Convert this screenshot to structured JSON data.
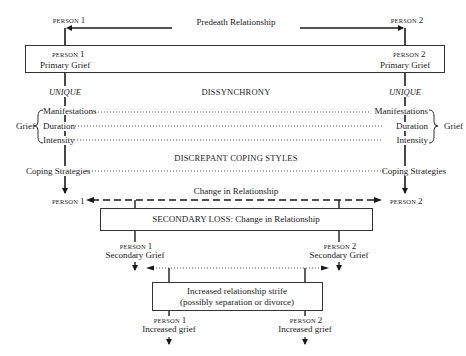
{
  "diagram": {
    "top": {
      "person1": "PERSON",
      "person1_num": "1",
      "person2": "PERSON",
      "person2_num": "2",
      "relationship": "Predeath Relationship"
    },
    "primary_box": {
      "person1": "PERSON",
      "person1_num": "1",
      "person1_label": "Primary Grief",
      "person2": "PERSON",
      "person2_num": "2",
      "person2_label": "Primary Grief"
    },
    "unique_left": "UNIQUE",
    "unique_right": "UNIQUE",
    "dissynchrony": "DISSYNCHRONY",
    "grief_left": "Grief",
    "grief_right": "Grief",
    "grief_items": [
      "Manifestations",
      "Duration",
      "Intensity"
    ],
    "discrepant": "DISCREPANT COPING STYLES",
    "coping_left": "Coping Strategies",
    "coping_right": "Coping Strategies",
    "change": {
      "label": "Change in Relationship",
      "person1": "PERSON",
      "person1_num": "1",
      "person2": "PERSON",
      "person2_num": "2"
    },
    "secondary_box": {
      "label": "SECONDARY LOSS: Change in Relationship"
    },
    "secondary": {
      "person1": "PERSON",
      "person1_num": "1",
      "person1_label": "Secondary Grief",
      "person2": "PERSON",
      "person2_num": "2",
      "person2_label": "Secondary Grief"
    },
    "strife_box": {
      "line1": "Increased relationship strife",
      "line2": "(possibly separation or divorce)"
    },
    "increased": {
      "person1": "PERSON",
      "person1_num": "1",
      "person1_label": "Increased grief",
      "person2": "PERSON",
      "person2_num": "2",
      "person2_label": "Increased grief"
    }
  }
}
